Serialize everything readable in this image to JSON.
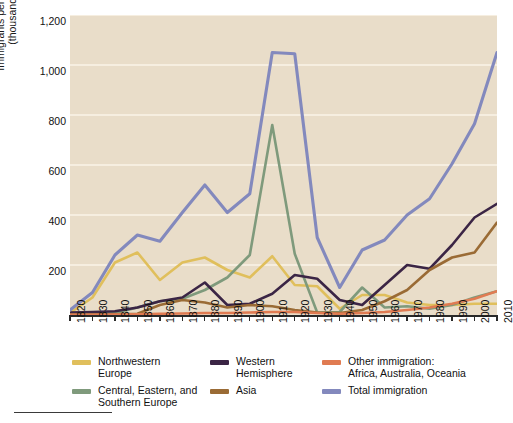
{
  "chart_data": {
    "type": "line",
    "title": "",
    "xlabel": "",
    "ylabel": "Immigrants per decade\n(thousands)",
    "ylim": [
      0,
      1200
    ],
    "yticks": [
      0,
      200,
      400,
      600,
      800,
      1000,
      1200
    ],
    "ytick_labels": [
      "0",
      "200",
      "400",
      "600",
      "800",
      "1,000",
      "1,200"
    ],
    "grid": true,
    "legend_position": "bottom",
    "x": [
      1820,
      1830,
      1840,
      1850,
      1860,
      1870,
      1880,
      1890,
      1900,
      1910,
      1920,
      1930,
      1940,
      1950,
      1960,
      1970,
      1980,
      1990,
      2000,
      2010
    ],
    "xtick_labels": [
      "1820",
      "1830",
      "1840",
      "1850",
      "1860",
      "1870",
      "1880",
      "1890",
      "1900",
      "1910",
      "1920",
      "1930",
      "1940",
      "1950",
      "1960",
      "1970",
      "1980",
      "1990",
      "2000",
      "2010"
    ],
    "series": [
      {
        "name": "Northwestern Europe",
        "color": "#e0bf5c",
        "values": [
          8,
          70,
          210,
          250,
          140,
          210,
          230,
          180,
          150,
          235,
          120,
          115,
          25,
          80,
          80,
          50,
          40,
          40,
          45,
          45
        ]
      },
      {
        "name": "Central, Eastern, and Southern Europe",
        "color": "#7f9a7c",
        "values": [
          2,
          5,
          8,
          30,
          55,
          65,
          100,
          150,
          240,
          760,
          245,
          10,
          12,
          110,
          30,
          35,
          25,
          40,
          70,
          95
        ]
      },
      {
        "name": "Western Hemisphere",
        "color": "#3b2545",
        "values": [
          10,
          12,
          15,
          30,
          55,
          70,
          130,
          40,
          45,
          85,
          160,
          145,
          60,
          40,
          120,
          200,
          185,
          280,
          390,
          445
        ]
      },
      {
        "name": "Asia",
        "color": "#9a6b35",
        "values": [
          2,
          2,
          3,
          5,
          40,
          60,
          50,
          30,
          40,
          35,
          20,
          10,
          8,
          20,
          55,
          100,
          180,
          230,
          250,
          370
        ]
      },
      {
        "name": "Other immigration: Africa, Australia, Oceania",
        "color": "#e07b52",
        "values": [
          1,
          1,
          2,
          3,
          5,
          6,
          8,
          8,
          10,
          12,
          12,
          8,
          5,
          8,
          12,
          20,
          30,
          45,
          65,
          95
        ]
      },
      {
        "name": "Total immigration",
        "color": "#8389bd",
        "values": [
          20,
          90,
          240,
          320,
          295,
          410,
          520,
          410,
          485,
          1050,
          1045,
          310,
          110,
          260,
          300,
          400,
          465,
          605,
          765,
          1050
        ]
      }
    ]
  },
  "y_axis": {
    "title": "Immigrants per decade\n(thousands)",
    "tick_labels": [
      "1,200",
      "1,000",
      "800",
      "600",
      "400",
      "200"
    ]
  },
  "legend": {
    "columns": [
      {
        "items": [
          {
            "label": "Northwestern\nEurope",
            "color": "#e0bf5c",
            "swatch": "line-swatch-northwestern-europe"
          },
          {
            "label": "Central, Eastern, and\nSouthern Europe",
            "color": "#7f9a7c",
            "swatch": "line-swatch-central-eastern-southern-europe"
          }
        ]
      },
      {
        "items": [
          {
            "label": "Western\nHemisphere",
            "color": "#3b2545",
            "swatch": "line-swatch-western-hemisphere"
          },
          {
            "label": "Asia",
            "color": "#9a6b35",
            "swatch": "line-swatch-asia"
          }
        ]
      },
      {
        "items": [
          {
            "label": "Other immigration:\nAfrica, Australia, Oceania",
            "color": "#e07b52",
            "swatch": "line-swatch-other-immigration"
          },
          {
            "label": "Total immigration",
            "color": "#8389bd",
            "swatch": "line-swatch-total-immigration"
          }
        ]
      }
    ]
  },
  "colors": {
    "plot_background": "#e9ddc9",
    "page_background": "#ffffff",
    "gridline": "#f6eee0",
    "axis": "#2a2a2a",
    "text": "#111111"
  }
}
